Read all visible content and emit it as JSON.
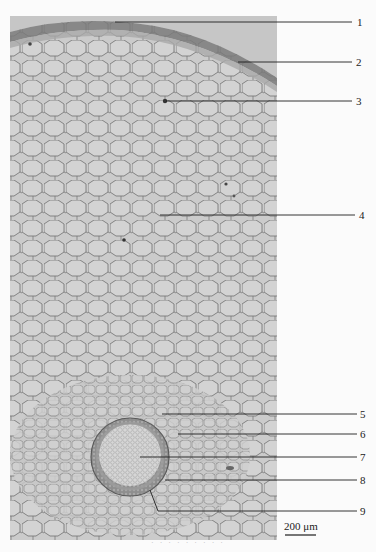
{
  "figure": {
    "type": "micrograph",
    "colors": {
      "panel": "#c9c9c9",
      "cell_wall": "#6f6f6f",
      "epidermis": "#7a7a7a",
      "stele_ring": "#8a8a8a",
      "stele_center": "#d4d4d4",
      "leader_line": "#1e1e1e",
      "background": "#fbfbfb"
    },
    "labels": [
      {
        "id": "1",
        "text": "1"
      },
      {
        "id": "2",
        "text": "2"
      },
      {
        "id": "3",
        "text": "3"
      },
      {
        "id": "4",
        "text": "4"
      },
      {
        "id": "5",
        "text": "5"
      },
      {
        "id": "6",
        "text": "6"
      },
      {
        "id": "7",
        "text": "7"
      },
      {
        "id": "8",
        "text": "8"
      },
      {
        "id": "9",
        "text": "9"
      }
    ],
    "scale_bar": {
      "text": "200 μm"
    },
    "caption": {
      "text": "· · ·  · ·  · · · ·"
    }
  }
}
